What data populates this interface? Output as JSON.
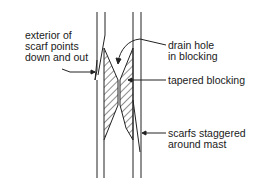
{
  "diagram": {
    "labels": {
      "exterior": [
        "exterior of",
        "scarf points",
        "down and out"
      ],
      "drain": [
        "drain hole",
        "in blocking"
      ],
      "blocking": [
        "tapered blocking"
      ],
      "staggered": [
        "scarfs staggered",
        "around mast"
      ]
    },
    "colors": {
      "line": "#222222",
      "background": "#ffffff"
    }
  }
}
